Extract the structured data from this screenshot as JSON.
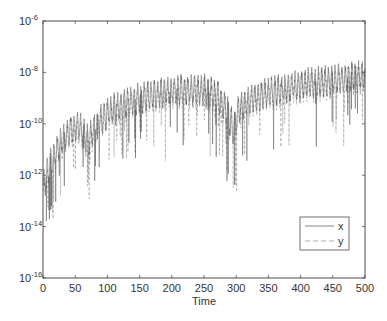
{
  "chart_data": {
    "type": "line",
    "title": "",
    "xlabel": "Time",
    "ylabel": "",
    "xlim": [
      0,
      500
    ],
    "ylim_log10": [
      -16,
      -6
    ],
    "yscale": "log",
    "grid": false,
    "legend_position": "lower right (inside)",
    "x_ticks": [
      0,
      50,
      100,
      150,
      200,
      250,
      300,
      350,
      400,
      450,
      500
    ],
    "y_ticks": [
      {
        "base": "10",
        "exp": "-6"
      },
      {
        "base": "10",
        "exp": "-8"
      },
      {
        "base": "10",
        "exp": "-10"
      },
      {
        "base": "10",
        "exp": "-12"
      },
      {
        "base": "10",
        "exp": "-14"
      },
      {
        "base": "10",
        "exp": "-16"
      }
    ],
    "series": [
      {
        "name": "x",
        "style": "solid",
        "color": "#555555",
        "envelope_x": [
          0,
          10,
          20,
          30,
          40,
          50,
          60,
          70,
          80,
          100,
          120,
          150,
          180,
          200,
          220,
          250,
          270,
          285,
          295,
          305,
          320,
          350,
          400,
          450,
          500
        ],
        "envelope_upper_log10": [
          -12,
          -11.2,
          -10.6,
          -10.2,
          -9.8,
          -9.6,
          -9.7,
          -10.2,
          -9.6,
          -9.1,
          -8.8,
          -8.5,
          -8.3,
          -8.2,
          -8.2,
          -8.2,
          -8.4,
          -8.9,
          -9.6,
          -8.9,
          -8.6,
          -8.3,
          -8.0,
          -7.8,
          -7.6
        ],
        "envelope_mid_log10": [
          -12.5,
          -11.8,
          -11.2,
          -10.8,
          -10.4,
          -10.2,
          -10.3,
          -10.9,
          -10.2,
          -9.7,
          -9.4,
          -9.1,
          -8.9,
          -8.8,
          -8.8,
          -8.8,
          -9.0,
          -9.6,
          -10.4,
          -9.5,
          -9.2,
          -8.9,
          -8.6,
          -8.4,
          -8.2
        ],
        "notes": "Oscillating signal with sharp downward spikes; deepest dip near t≈295 reaching ~1e-12.5; early spikes near t≈5–15 reaching ~1e-14"
      },
      {
        "name": "y",
        "style": "dashed",
        "color": "#888888",
        "notes": "Closely tracks x, slightly lower amplitude"
      }
    ]
  },
  "legend": {
    "items": [
      {
        "label": "x",
        "style": "solid"
      },
      {
        "label": "y",
        "style": "dashed"
      }
    ]
  },
  "colors": {
    "axis": "#4d4d4d",
    "series_x": "#5a5a5a",
    "series_y": "#8c8c8c",
    "background": "#ffffff"
  }
}
